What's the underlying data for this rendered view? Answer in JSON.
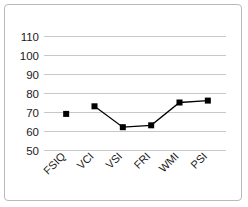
{
  "chart_data": {
    "type": "line",
    "title": "",
    "xlabel": "",
    "ylabel": "",
    "categories": [
      "FSIQ",
      "VCI",
      "VSI",
      "FRI",
      "WMI",
      "PSI"
    ],
    "values": [
      69,
      73,
      62,
      63,
      75,
      76
    ],
    "series": [
      {
        "name": "Index Score",
        "values": [
          69,
          73,
          62,
          63,
          75,
          76
        ]
      }
    ],
    "ylim": [
      50,
      110
    ],
    "yticks": [
      50,
      60,
      70,
      80,
      90,
      100,
      110
    ],
    "ytick_labels": [
      "50",
      "60",
      "70",
      "80",
      "90",
      "100",
      "110"
    ],
    "grid": true,
    "grid_axis": "y",
    "legend": false,
    "legend_position": "none",
    "marker": "square",
    "marker_color": "#000000",
    "line_color": "#000000",
    "grid_color": "#c8c8c8",
    "background_color": "#ffffff",
    "xlabel_rotation": 45,
    "first_point_disconnected": true,
    "annotations": []
  },
  "frame": {
    "border_color": "#b9b9b9"
  }
}
